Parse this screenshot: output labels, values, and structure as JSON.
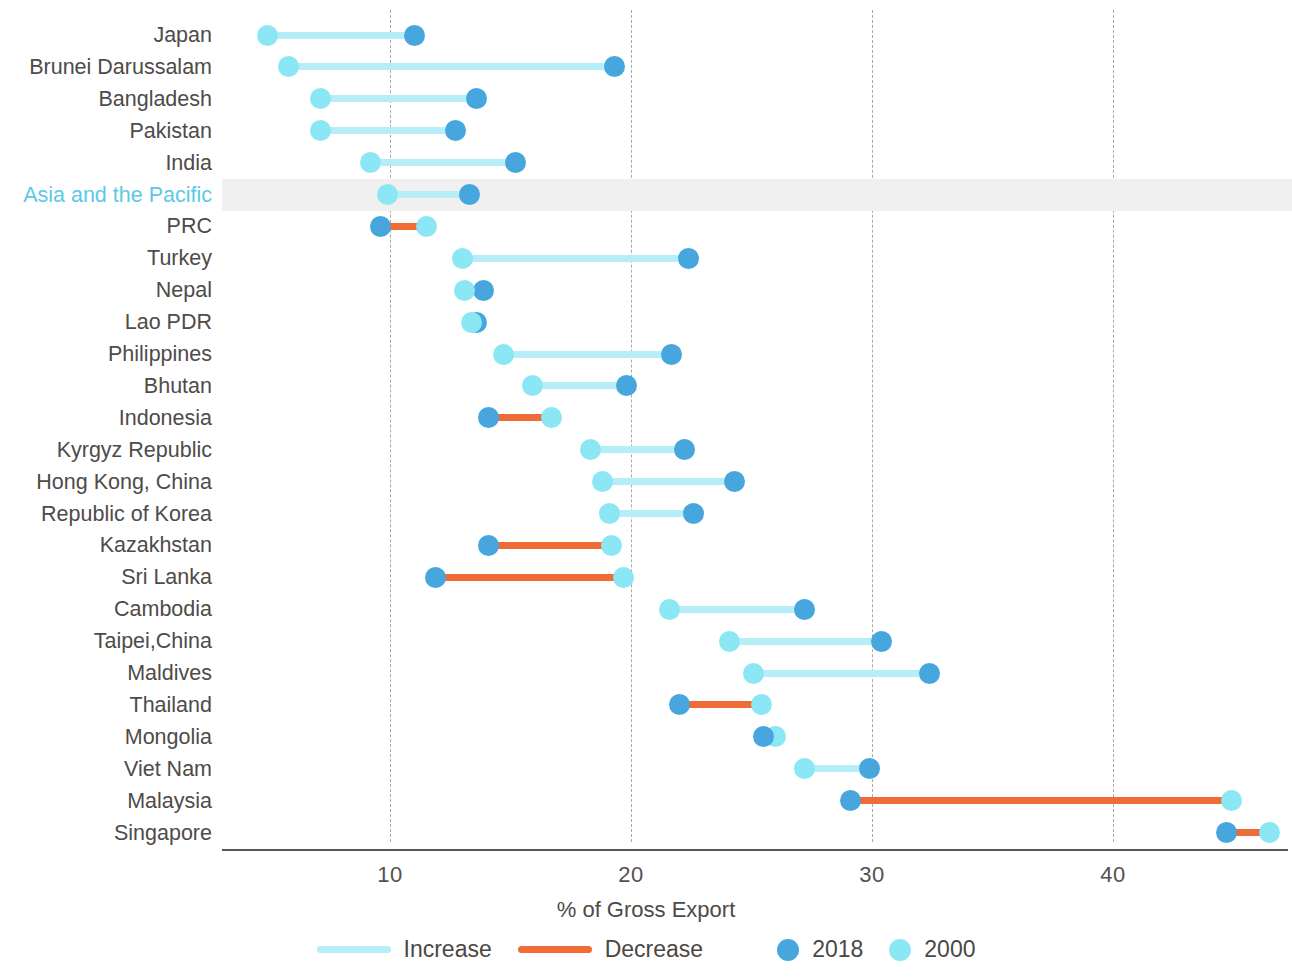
{
  "chart_data": {
    "type": "dumbbell",
    "title": "",
    "xlabel": "% of Gross Export",
    "ylabel": "",
    "xlim": [
      3.5,
      48
    ],
    "xticks": [
      10,
      20,
      30,
      40
    ],
    "grid": "vertical-dashed",
    "legend": {
      "position": "bottom",
      "entries": [
        {
          "label": "Increase",
          "kind": "line",
          "color": "#b5eef8"
        },
        {
          "label": "Decrease",
          "kind": "line",
          "color": "#f06c36"
        },
        {
          "label": "2018",
          "kind": "dot",
          "color": "#46a6dd"
        },
        {
          "label": "2000",
          "kind": "dot",
          "color": "#8ce7f4"
        }
      ]
    },
    "series": [
      {
        "name": "2000",
        "color": "#8ce7f4"
      },
      {
        "name": "2018",
        "color": "#46a6dd"
      }
    ],
    "colors": {
      "increase": "#b5eef8",
      "decrease": "#f06c36",
      "dot_2018": "#46a6dd",
      "dot_2000": "#8ce7f4",
      "highlight_row": "#f0f0f0",
      "accent_label": "#5ec8e8"
    },
    "highlight_category": "Asia and the Pacific",
    "categories": [
      "Japan",
      "Brunei Darussalam",
      "Bangladesh",
      "Pakistan",
      "India",
      "Asia and the Pacific",
      "PRC",
      "Turkey",
      "Nepal",
      "Lao PDR",
      "Philippines",
      "Bhutan",
      "Indonesia",
      "Kyrgyz Republic",
      "Hong Kong, China",
      "Republic of Korea",
      "Kazakhstan",
      "Sri Lanka",
      "Cambodia",
      "Taipei,China",
      "Maldives",
      "Thailand",
      "Mongolia",
      "Viet Nam",
      "Malaysia",
      "Singapore"
    ],
    "rows": [
      {
        "category": "Japan",
        "v2000": 4.9,
        "v2018": 11.0,
        "change": "increase"
      },
      {
        "category": "Brunei Darussalam",
        "v2000": 5.8,
        "v2018": 19.3,
        "change": "increase"
      },
      {
        "category": "Bangladesh",
        "v2000": 7.1,
        "v2018": 13.6,
        "change": "increase"
      },
      {
        "category": "Pakistan",
        "v2000": 7.1,
        "v2018": 12.7,
        "change": "increase"
      },
      {
        "category": "India",
        "v2000": 9.2,
        "v2018": 15.2,
        "change": "increase"
      },
      {
        "category": "Asia and the Pacific",
        "v2000": 9.9,
        "v2018": 13.3,
        "change": "increase"
      },
      {
        "category": "PRC",
        "v2000": 11.5,
        "v2018": 9.6,
        "change": "decrease"
      },
      {
        "category": "Turkey",
        "v2000": 13.0,
        "v2018": 22.4,
        "change": "increase"
      },
      {
        "category": "Nepal",
        "v2000": 13.1,
        "v2018": 13.9,
        "change": "increase"
      },
      {
        "category": "Lao PDR",
        "v2000": 13.4,
        "v2018": 13.6,
        "change": "increase"
      },
      {
        "category": "Philippines",
        "v2000": 14.7,
        "v2018": 21.7,
        "change": "increase"
      },
      {
        "category": "Bhutan",
        "v2000": 15.9,
        "v2018": 19.8,
        "change": "increase"
      },
      {
        "category": "Indonesia",
        "v2000": 16.7,
        "v2018": 14.1,
        "change": "decrease"
      },
      {
        "category": "Kyrgyz Republic",
        "v2000": 18.3,
        "v2018": 22.2,
        "change": "increase"
      },
      {
        "category": "Hong Kong, China",
        "v2000": 18.8,
        "v2018": 24.3,
        "change": "increase"
      },
      {
        "category": "Republic of Korea",
        "v2000": 19.1,
        "v2018": 22.6,
        "change": "increase"
      },
      {
        "category": "Kazakhstan",
        "v2000": 19.2,
        "v2018": 14.1,
        "change": "decrease"
      },
      {
        "category": "Sri Lanka",
        "v2000": 19.7,
        "v2018": 11.9,
        "change": "decrease"
      },
      {
        "category": "Cambodia",
        "v2000": 21.6,
        "v2018": 27.2,
        "change": "increase"
      },
      {
        "category": "Taipei,China",
        "v2000": 24.1,
        "v2018": 30.4,
        "change": "increase"
      },
      {
        "category": "Maldives",
        "v2000": 25.1,
        "v2018": 32.4,
        "change": "increase"
      },
      {
        "category": "Thailand",
        "v2000": 25.4,
        "v2018": 22.0,
        "change": "decrease"
      },
      {
        "category": "Mongolia",
        "v2000": 26.0,
        "v2018": 25.5,
        "change": "decrease"
      },
      {
        "category": "Viet Nam",
        "v2000": 27.2,
        "v2018": 29.9,
        "change": "increase"
      },
      {
        "category": "Malaysia",
        "v2000": 44.9,
        "v2018": 29.1,
        "change": "decrease"
      },
      {
        "category": "Singapore",
        "v2000": 46.5,
        "v2018": 44.7,
        "change": "decrease"
      }
    ]
  }
}
